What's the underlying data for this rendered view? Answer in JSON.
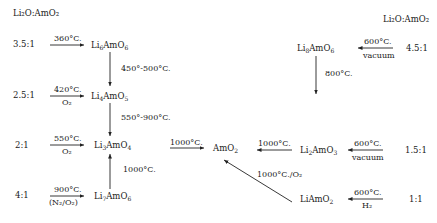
{
  "headers": {
    "left": "Li₂O:AmO₂",
    "right": "Li₂O:AmO₂"
  },
  "ratios": {
    "r35": "3.5:1",
    "r25": "2.5:1",
    "r2": "2:1",
    "r4": "4:1",
    "r45": "4.5:1",
    "r15": "1.5:1",
    "r1": "1:1"
  },
  "compounds": {
    "li6amo6": {
      "base": "Li",
      "sub1": "6",
      "mid": "AmO",
      "sub2": "6"
    },
    "li4amo5": {
      "base": "Li",
      "sub1": "4",
      "mid": "AmO",
      "sub2": "5"
    },
    "li3amo4": {
      "base": "Li",
      "sub1": "3",
      "mid": "AmO",
      "sub2": "4"
    },
    "li7amo6": {
      "base": "Li",
      "sub1": "7",
      "mid": "AmO",
      "sub2": "6"
    },
    "li8amo6": {
      "base": "Li",
      "sub1": "8",
      "mid": "AmO",
      "sub2": "6"
    },
    "li2amo3": {
      "base": "Li",
      "sub1": "2",
      "mid": "AmO",
      "sub2": "3"
    },
    "liamo2": {
      "base": "Li",
      "sub1": "",
      "mid": "AmO",
      "sub2": "2"
    },
    "amo2": {
      "base": "",
      "sub1": "",
      "mid": "AmO",
      "sub2": "2"
    }
  },
  "conditions": {
    "c360": "360°C.",
    "c420": "420°C.",
    "c420_atm": "O₂",
    "c550": "550°C.",
    "c550_atm": "O₂",
    "c900": "900°C.",
    "c900_atm": "(N₂/O₂)",
    "c450_500": "450°-500°C.",
    "c550_900": "550°-900°C.",
    "c1000_up": "1000°C.",
    "c1000_right": "1000°C.",
    "c1000_left": "1000°C.",
    "c1000_diag": "1000°C./O₂",
    "c800": "800°C.",
    "c600a": "600°C.",
    "c600a_atm": "vacuum",
    "c600b": "600°C.",
    "c600b_atm": "vacuum",
    "c600c": "600°C.",
    "c600c_atm": "H₂"
  }
}
